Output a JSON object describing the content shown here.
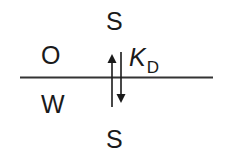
{
  "diagram": {
    "type": "partition-equilibrium",
    "phases": {
      "upper": {
        "label": "O"
      },
      "lower": {
        "label": "W"
      }
    },
    "species": {
      "top": "S",
      "bottom": "S"
    },
    "coefficient": {
      "symbol": "K",
      "subscript": "D"
    },
    "colors": {
      "ink": "#1a1a1a",
      "interface_line": "#333333",
      "background": "#ffffff"
    }
  }
}
